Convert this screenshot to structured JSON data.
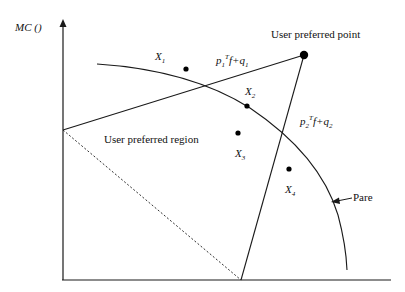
{
  "diagram": {
    "axis_y_label": "MC ()",
    "labels": {
      "user_preferred_point": "User preferred point",
      "user_preferred_region": "User preferred region",
      "pareto": "Pare",
      "line1": {
        "p": "p",
        "p_sub": "1",
        "sup": "T",
        "mid": "f+",
        "q": "q",
        "q_sub": "1"
      },
      "line2": {
        "p": "p",
        "p_sub": "2",
        "sup": "T",
        "mid": "f+",
        "q": "q",
        "q_sub": "2"
      },
      "points": [
        {
          "name": "X",
          "sub": "1"
        },
        {
          "name": "X",
          "sub": "2"
        },
        {
          "name": "X",
          "sub": "3"
        },
        {
          "name": "X",
          "sub": "4"
        }
      ]
    },
    "colors": {
      "line": "#1a1a1a",
      "background": "#ffffff"
    }
  }
}
